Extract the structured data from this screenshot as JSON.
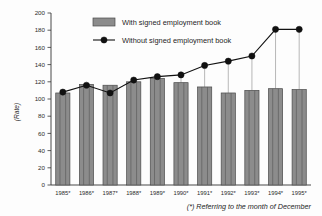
{
  "chart_data": {
    "type": "bar",
    "title": "",
    "xlabel": "",
    "ylabel": "(Rate)",
    "ylim": [
      0,
      200
    ],
    "ytick_step": 20,
    "grid": false,
    "legend_position": "top-center",
    "categories": [
      "1985*",
      "1986*",
      "1987*",
      "1988*",
      "1989*",
      "1990*",
      "1991*",
      "1992*",
      "1993*",
      "1994*",
      "1995*"
    ],
    "yticks": [
      "0",
      "20",
      "40",
      "60",
      "80",
      "100",
      "120",
      "140",
      "160",
      "180",
      "200"
    ],
    "series": [
      {
        "name": "With signed employment book",
        "kind": "bar",
        "color": "#8c8c8c",
        "values": [
          107,
          117,
          116,
          120,
          124,
          119,
          114,
          107,
          110,
          112,
          111
        ]
      },
      {
        "name": "Without signed employment book",
        "kind": "line",
        "color": "#111111",
        "values": [
          108,
          116,
          107,
          122,
          126,
          128,
          139,
          144,
          150,
          181,
          181
        ]
      }
    ],
    "footnote": "(*) Referring to the month of December"
  },
  "legend": {
    "entries": [
      {
        "label": "With signed employment book",
        "marker": "bar-swatch"
      },
      {
        "label": "Without signed employment book",
        "marker": "line-dot"
      }
    ]
  },
  "axes": {
    "y_axis_title": "(Rate)"
  },
  "footnote": {
    "text": "(*) Referring to the month of December"
  }
}
